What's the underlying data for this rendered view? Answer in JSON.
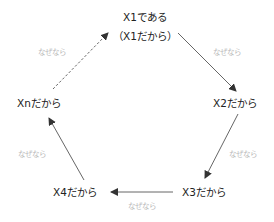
{
  "diagram": {
    "type": "cycle",
    "nodes": [
      {
        "id": "x1",
        "line1": "X1である",
        "line2": "（X1だから）"
      },
      {
        "id": "x2",
        "label": "X2だから"
      },
      {
        "id": "x3",
        "label": "X3だから"
      },
      {
        "id": "x4",
        "label": "X4だから"
      },
      {
        "id": "xn",
        "label": "Xnだから"
      }
    ],
    "edges": [
      {
        "from": "x1",
        "to": "x2",
        "style": "solid",
        "label": "なぜなら"
      },
      {
        "from": "x2",
        "to": "x3",
        "style": "solid",
        "label": "なぜなら"
      },
      {
        "from": "x3",
        "to": "x4",
        "style": "solid",
        "label": "なぜなら"
      },
      {
        "from": "x4",
        "to": "xn",
        "style": "solid",
        "label": "なぜなら"
      },
      {
        "from": "xn",
        "to": "x1",
        "style": "dashed",
        "label": "なぜなら"
      }
    ],
    "colors": {
      "node_text": "#222222",
      "edge_label": "#b8b8b8",
      "arrow": "#444444"
    }
  }
}
